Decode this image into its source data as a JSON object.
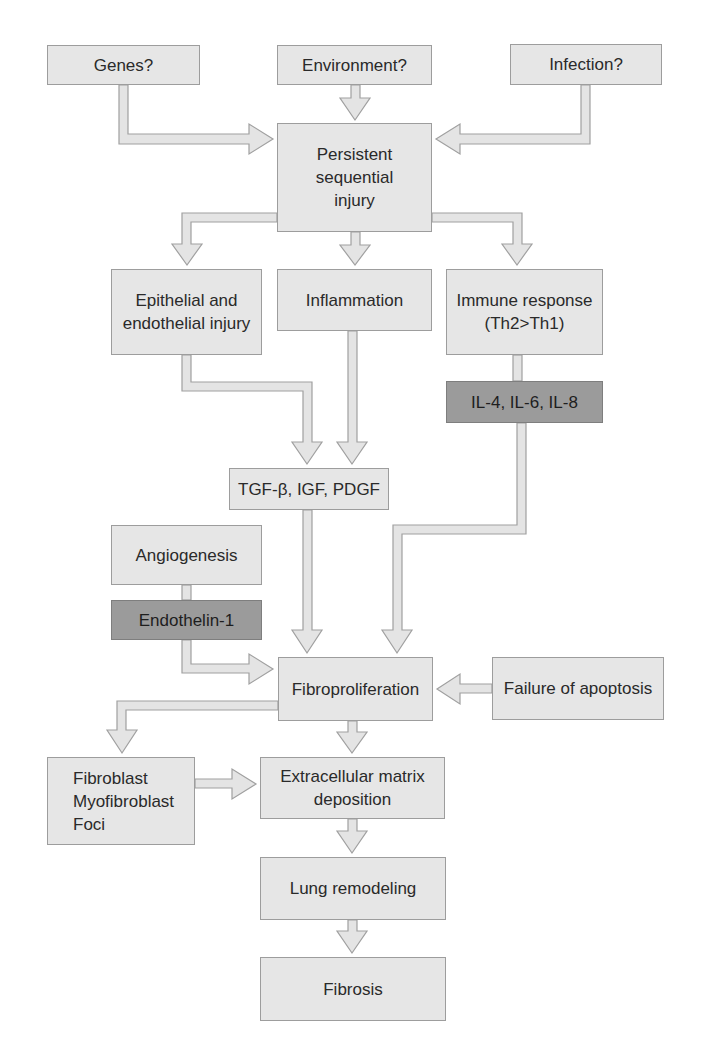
{
  "diagram": {
    "title": "",
    "colors": {
      "box_fill": "#e6e6e6",
      "box_border": "#9d9d9d",
      "dark_box_fill": "#9b9b9b",
      "arrow_fill": "#e4e4e4",
      "arrow_stroke": "#a0a0a0",
      "text": "#2a2a2a"
    },
    "nodes": {
      "genes": "Genes?",
      "environment": "Environment?",
      "infection": "Infection?",
      "persistent_injury": "Persistent\nsequential\ninjury",
      "epithelial_injury": "Epithelial and\nendothelial injury",
      "inflammation": "Inflammation",
      "immune_response": "Immune response\n(Th2>Th1)",
      "interleukins": "IL-4, IL-6, IL-8",
      "growth_factors": "TGF-β, IGF, PDGF",
      "angiogenesis": "Angiogenesis",
      "endothelin": "Endothelin-1",
      "fibroproliferation": "Fibroproliferation",
      "failure_apoptosis": "Failure of apoptosis",
      "fibroblast_foci": "Fibroblast\nMyofibroblast\nFoci",
      "ecm_deposition": "Extracellular matrix\ndeposition",
      "lung_remodeling": "Lung remodeling",
      "fibrosis": "Fibrosis"
    },
    "edges": [
      [
        "genes",
        "persistent_injury"
      ],
      [
        "environment",
        "persistent_injury"
      ],
      [
        "infection",
        "persistent_injury"
      ],
      [
        "persistent_injury",
        "epithelial_injury"
      ],
      [
        "persistent_injury",
        "inflammation"
      ],
      [
        "persistent_injury",
        "immune_response"
      ],
      [
        "immune_response",
        "interleukins"
      ],
      [
        "epithelial_injury",
        "growth_factors"
      ],
      [
        "inflammation",
        "growth_factors"
      ],
      [
        "interleukins",
        "fibroproliferation"
      ],
      [
        "growth_factors",
        "fibroproliferation"
      ],
      [
        "angiogenesis",
        "endothelin"
      ],
      [
        "endothelin",
        "fibroproliferation"
      ],
      [
        "failure_apoptosis",
        "fibroproliferation"
      ],
      [
        "fibroproliferation",
        "fibroblast_foci"
      ],
      [
        "fibroproliferation",
        "ecm_deposition"
      ],
      [
        "fibroblast_foci",
        "ecm_deposition"
      ],
      [
        "ecm_deposition",
        "lung_remodeling"
      ],
      [
        "lung_remodeling",
        "fibrosis"
      ]
    ]
  }
}
